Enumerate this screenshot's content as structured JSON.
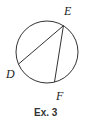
{
  "figure": {
    "caption": "Ex. 3",
    "circle": {
      "stroke": "#333333"
    },
    "points": [
      {
        "id": "E",
        "label": "E",
        "angle_deg": -58
      },
      {
        "id": "D",
        "label": "D",
        "angle_deg": 157
      },
      {
        "id": "F",
        "label": "F",
        "angle_deg": 76
      }
    ],
    "chords": [
      {
        "from": "E",
        "to": "D"
      },
      {
        "from": "E",
        "to": "F"
      }
    ]
  }
}
